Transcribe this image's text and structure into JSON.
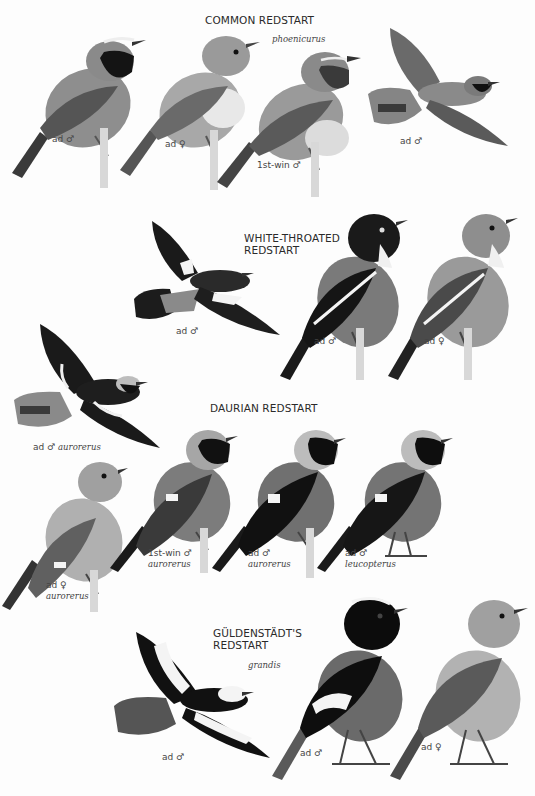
{
  "plate": {
    "species": [
      {
        "title": "COMMON REDSTART",
        "subspecies": "phoenicurus",
        "figures": [
          {
            "label": "ad ♂",
            "pose": "perched",
            "tone": "dark-throat"
          },
          {
            "label": "ad ♀",
            "pose": "perched",
            "tone": "plain"
          },
          {
            "label": "1st-win ♂",
            "pose": "perched",
            "tone": "scaly"
          },
          {
            "label": "ad ♂",
            "pose": "flight",
            "tone": "dark-throat"
          }
        ]
      },
      {
        "title_line1": "WHITE-THROATED",
        "title_line2": "REDSTART",
        "figures": [
          {
            "label": "ad ♂",
            "pose": "flight",
            "tone": "black-white-patch"
          },
          {
            "label": "ad ♂",
            "pose": "perched",
            "tone": "black-white-stripe"
          },
          {
            "label": "ad ♀",
            "pose": "perched",
            "tone": "plain-white-stripe"
          }
        ]
      },
      {
        "title": "DAURIAN REDSTART",
        "figures": [
          {
            "label": "ad ♂",
            "label_italic": "aurorerus",
            "pose": "flight"
          },
          {
            "label": "ad ♀",
            "label_italic": "aurorerus",
            "pose": "perched"
          },
          {
            "label": "1st-win ♂",
            "label_italic": "aurorerus",
            "pose": "perched"
          },
          {
            "label": "ad ♂",
            "label_italic": "aurorerus",
            "pose": "perched"
          },
          {
            "label": "ad ♂",
            "label_italic": "leucopterus",
            "pose": "perched"
          }
        ]
      },
      {
        "title_line1": "GÜLDENSTÄDT'S",
        "title_line2": "REDSTART",
        "subspecies": "grandis",
        "figures": [
          {
            "label": "ad ♂",
            "pose": "flight"
          },
          {
            "label": "ad ♂",
            "pose": "perched"
          },
          {
            "label": "ad ♀",
            "pose": "perched"
          }
        ]
      }
    ]
  }
}
